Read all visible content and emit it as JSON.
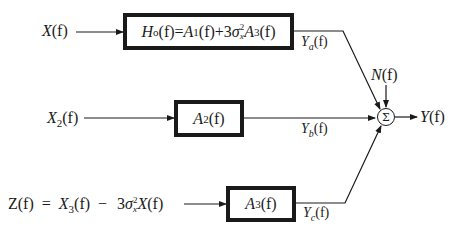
{
  "diagram": {
    "inputs": {
      "x": {
        "name": "X",
        "arg": "(f)"
      },
      "x2": {
        "name": "X",
        "sub": "2",
        "arg": "(f)"
      },
      "z": {
        "lhs_name": "Z",
        "lhs_arg": "(f)",
        "eq": "=",
        "term1_name": "X",
        "term1_sub": "3",
        "term1_arg": "(f)",
        "minus": "−",
        "coef": "3",
        "sigma": "σ",
        "sigma_sub": "x",
        "sigma_sup": "2",
        "term2_name": "X",
        "term2_arg": "(f)"
      },
      "noise": {
        "name": "N",
        "arg": "(f)"
      }
    },
    "blocks": {
      "h0": {
        "h_name": "H",
        "h_sub": "o",
        "h_arg": "(f)",
        "eq": "=",
        "a1_name": "A",
        "a1_sub": "1",
        "a1_arg": "(f)",
        "plus": "+",
        "coef": "3",
        "sigma": "σ",
        "sigma_sub": "x",
        "sigma_sup": "2",
        "a3_name": "A",
        "a3_sub": "3",
        "a3_arg": "(f)"
      },
      "a2": {
        "name": "A",
        "sub": "2",
        "arg": "(f)"
      },
      "a3": {
        "name": "A",
        "sub": "3",
        "arg": "(f)"
      }
    },
    "signals": {
      "ya": {
        "name": "Y",
        "sub": "a",
        "arg": "(f)"
      },
      "yb": {
        "name": "Y",
        "sub": "b",
        "arg": "(f)"
      },
      "yc": {
        "name": "Y",
        "sub": "c",
        "arg": "(f)"
      }
    },
    "summer": {
      "symbol": "Σ"
    },
    "output": {
      "name": "Y",
      "arg": "(f)"
    },
    "colors": {
      "ink": "#1a1a1a",
      "background": "#ffffff"
    }
  }
}
